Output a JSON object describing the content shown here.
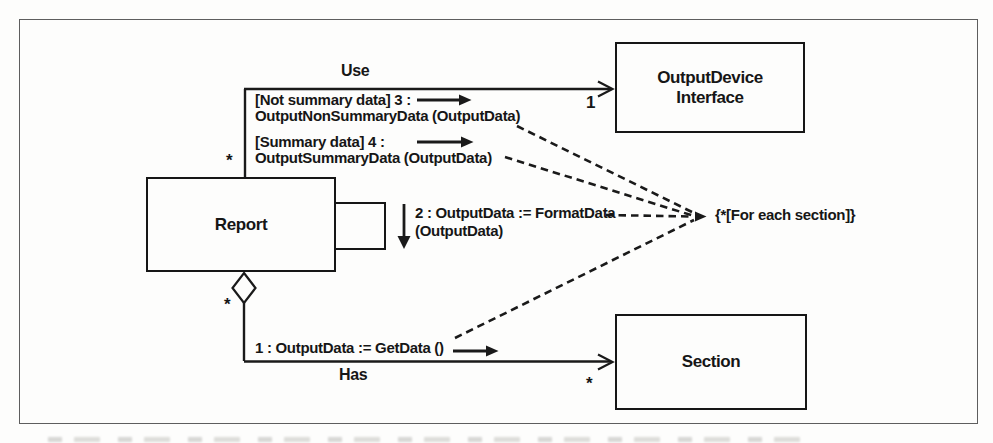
{
  "figure": {
    "background_color": "#fdfdfc",
    "line_color": "#1a1a1a"
  },
  "classes": {
    "report": {
      "name": "Report"
    },
    "output_device": {
      "name_line1": "OutputDevice",
      "name_line2": "Interface"
    },
    "section": {
      "name": "Section"
    }
  },
  "associations": {
    "use": {
      "label": "Use",
      "source_multiplicity": "*",
      "target_multiplicity": "1"
    },
    "has": {
      "label": "Has",
      "source_multiplicity": "*",
      "target_multiplicity": "*"
    }
  },
  "messages": {
    "get_data": {
      "text": "1 : OutputData := GetData ()"
    },
    "format_data": {
      "line1": "2 : OutputData := FormatData",
      "line2": "(OutputData)"
    },
    "output_non_summary": {
      "line1": "[Not summary data] 3 :",
      "line2": "OutputNonSummaryData (OutputData)"
    },
    "output_summary": {
      "line1": "[Summary data] 4 :",
      "line2": "OutputSummaryData (OutputData)"
    }
  },
  "constraint": {
    "text": "{*[For each section]}"
  }
}
